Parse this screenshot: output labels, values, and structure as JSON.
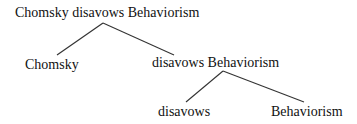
{
  "tree": {
    "root": {
      "label": "Chomsky disavows Behaviorism"
    },
    "level1": {
      "left": {
        "label": "Chomsky"
      },
      "right": {
        "label": "disavows Behaviorism"
      }
    },
    "level2": {
      "left": {
        "label": "disavows"
      },
      "right": {
        "label": "Behaviorism"
      }
    }
  },
  "colors": {
    "text": "#111111",
    "line": "#333333",
    "background": "#ffffff"
  }
}
